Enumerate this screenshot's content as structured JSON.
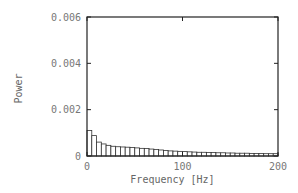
{
  "chart_data": {
    "type": "bar",
    "title": "",
    "xlabel": "Frequency [Hz]",
    "ylabel": "Power",
    "xlim": [
      0,
      200
    ],
    "ylim": [
      0,
      0.006
    ],
    "xticks": [
      0,
      100,
      200
    ],
    "xtick_labels": [
      "0",
      "100",
      "200"
    ],
    "yticks": [
      0,
      0.002,
      0.004,
      0.006
    ],
    "ytick_labels": [
      "0",
      "0.002",
      "0.004",
      "0.006"
    ],
    "grid": false,
    "legend": null,
    "bar_width_hz": 5,
    "x": [
      0,
      5,
      10,
      15,
      20,
      25,
      30,
      35,
      40,
      45,
      50,
      55,
      60,
      65,
      70,
      75,
      80,
      85,
      90,
      95,
      100,
      105,
      110,
      115,
      120,
      125,
      130,
      135,
      140,
      145,
      150,
      155,
      160,
      165,
      170,
      175,
      180,
      185,
      190,
      195
    ],
    "values": [
      0.0011,
      0.00088,
      0.0006,
      0.00052,
      0.00046,
      0.00042,
      0.0004,
      0.00039,
      0.00038,
      0.00037,
      0.00035,
      0.00033,
      0.00032,
      0.0003,
      0.00028,
      0.00026,
      0.00024,
      0.00022,
      0.00021,
      0.0002,
      0.00019,
      0.00018,
      0.00017,
      0.00016,
      0.00016,
      0.00015,
      0.00015,
      0.00014,
      0.00014,
      0.00013,
      0.00013,
      0.00012,
      0.00012,
      0.00012,
      0.00011,
      0.00011,
      0.00011,
      0.0001,
      0.0001,
      0.0001
    ]
  },
  "colors": {
    "axis": "#222222",
    "bar_edge": "#333333",
    "bar_fill": "#ffffff",
    "text": "#777777"
  }
}
